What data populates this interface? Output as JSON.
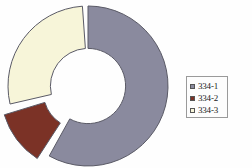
{
  "chart_data": {
    "type": "pie",
    "variant": "doughnut-exploded",
    "title": "",
    "subtitle": "",
    "xlabel": "",
    "ylabel": "",
    "grid": false,
    "legend_position": "right",
    "hole_ratio": 0.47,
    "start_angle_deg": 0,
    "direction": "clockwise",
    "categories": [
      "334-1",
      "334-2",
      "334-3"
    ],
    "values": [
      58,
      12,
      30
    ],
    "units": "percent",
    "colors": [
      "#8a8a9e",
      "#7b3226",
      "#f7f5d9"
    ],
    "series": [
      {
        "name": "334",
        "values": [
          58,
          12,
          30
        ]
      }
    ],
    "slices": [
      {
        "label": "334-1",
        "value": 58,
        "color": "#8a8a9e",
        "start_angle_deg": 0,
        "end_angle_deg": 209,
        "exploded": false
      },
      {
        "label": "334-2",
        "value": 12,
        "color": "#7b3226",
        "start_angle_deg": 213,
        "end_angle_deg": 253,
        "exploded": true
      },
      {
        "label": "334-3",
        "value": 30,
        "color": "#f7f5d9",
        "start_angle_deg": 257,
        "end_angle_deg": 356,
        "exploded": false
      }
    ],
    "legend": [
      {
        "label": "334-1",
        "color": "#8a8a9e"
      },
      {
        "label": "334-2",
        "color": "#7b3226"
      },
      {
        "label": "334-3",
        "color": "#f7f5d9"
      }
    ]
  },
  "legend": {
    "items": [
      {
        "label": "334-1",
        "color": "#8a8a9e"
      },
      {
        "label": "334-2",
        "color": "#7b3226"
      },
      {
        "label": "334-3",
        "color": "#f7f5d9"
      }
    ]
  },
  "style": {
    "background": "#fefefe",
    "outline": "#5a5a66",
    "legend_border": "#9a9a9a",
    "text": "#1a1a1a"
  }
}
